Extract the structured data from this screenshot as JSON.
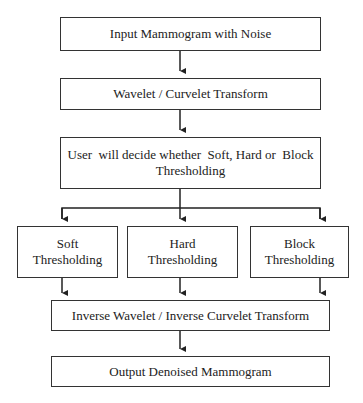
{
  "diagram": {
    "type": "flowchart",
    "nodes": {
      "input": "Input Mammogram with Noise",
      "transform": "Wavelet / Curvelet Transform",
      "decision": "User  will decide whether  Soft, Hard or  Block Thresholding",
      "soft": "Soft Thresholding",
      "hard": "Hard Thresholding",
      "block": "Block Thresholding",
      "inverse": "Inverse Wavelet / Inverse Curvelet Transform",
      "output": "Output Denoised Mammogram"
    },
    "edges": [
      [
        "input",
        "transform"
      ],
      [
        "transform",
        "decision"
      ],
      [
        "decision",
        "soft"
      ],
      [
        "decision",
        "hard"
      ],
      [
        "decision",
        "block"
      ],
      [
        "soft",
        "inverse"
      ],
      [
        "hard",
        "inverse"
      ],
      [
        "block",
        "inverse"
      ],
      [
        "inverse",
        "output"
      ]
    ]
  }
}
